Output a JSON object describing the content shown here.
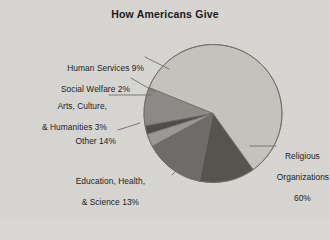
{
  "chart_data": {
    "type": "pie",
    "title": "How Americans Give",
    "xlabel": "",
    "ylabel": "",
    "legend_position": "none",
    "grid": false,
    "categories": [
      "Religious Organizations",
      "Human Services",
      "Social Welfare",
      "Arts, Culture, & Humanities",
      "Other",
      "Education, Health, & Science"
    ],
    "values": [
      60,
      9,
      2,
      3,
      14,
      13
    ],
    "value_suffix": "%",
    "slices": [
      {
        "name": "Religious Organizations",
        "value": 60,
        "label_line_1": "Religious",
        "label_line_2": "Organizations",
        "label_line_3": "60%",
        "color": "#c3c2bd",
        "start_deg": -58,
        "sweep_deg": 216
      },
      {
        "name": "Human Services",
        "value": 9,
        "label_line_1": "Human Services 9%",
        "label_line_2": "",
        "label_line_3": "",
        "color": "#8b8a86",
        "start_deg": 158,
        "sweep_deg": 32.4
      },
      {
        "name": "Social Welfare",
        "value": 2,
        "label_line_1": "Social Welfare 2%",
        "label_line_2": "",
        "label_line_3": "",
        "color": "#4f4e4b",
        "start_deg": 190.4,
        "sweep_deg": 7.2
      },
      {
        "name": "Arts, Culture, & Humanities",
        "value": 3,
        "label_line_1": "Arts, Culture,",
        "label_line_2": "& Humanities 3%",
        "label_line_3": "",
        "color": "#9a9995",
        "start_deg": 197.6,
        "sweep_deg": 10.8
      },
      {
        "name": "Other",
        "value": 14,
        "label_line_1": "Other 14%",
        "label_line_2": "",
        "label_line_3": "",
        "color": "#6d6c69",
        "start_deg": 208.4,
        "sweep_deg": 50.4
      },
      {
        "name": "Education, Health, & Science",
        "value": 13,
        "label_line_1": "Education, Health,",
        "label_line_2": "& Science 13%",
        "label_line_3": "",
        "color": "#55544f",
        "start_deg": 258.8,
        "sweep_deg": 46.8
      }
    ],
    "colors": {
      "background": "#d8d7d3",
      "text": "#1d1d1d",
      "outline": "#6e6d69",
      "leader_line": "#6e6d69"
    }
  }
}
